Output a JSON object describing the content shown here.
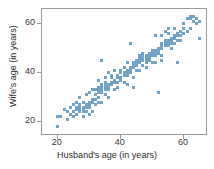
{
  "chart_data": {
    "type": "scatter",
    "title": "",
    "xlabel": "Husband's age (in years)",
    "ylabel": "Wife's age (in years)",
    "xlim": [
      15,
      67
    ],
    "ylim": [
      15,
      66
    ],
    "xticks": [
      20,
      40,
      60
    ],
    "yticks": [
      20,
      40,
      60
    ],
    "xtick_labels": [
      "20",
      "40",
      "60"
    ],
    "ytick_labels": [
      "20",
      "40",
      "60"
    ],
    "grid": false,
    "legend": null,
    "marker": {
      "shape": "square",
      "color": "#6a9fc4",
      "size_px": 3
    },
    "series": [
      {
        "name": "Married couples",
        "points": [
          [
            20,
            18
          ],
          [
            20,
            22
          ],
          [
            21,
            22
          ],
          [
            22,
            25
          ],
          [
            23,
            21
          ],
          [
            23,
            24
          ],
          [
            24,
            23
          ],
          [
            24,
            26
          ],
          [
            25,
            24
          ],
          [
            25,
            27
          ],
          [
            25,
            22
          ],
          [
            26,
            25
          ],
          [
            26,
            26
          ],
          [
            26,
            23
          ],
          [
            26,
            28
          ],
          [
            27,
            24
          ],
          [
            27,
            25
          ],
          [
            27,
            26
          ],
          [
            27,
            27
          ],
          [
            27,
            30
          ],
          [
            28,
            25
          ],
          [
            28,
            26
          ],
          [
            28,
            24
          ],
          [
            28,
            28
          ],
          [
            29,
            26
          ],
          [
            29,
            27
          ],
          [
            29,
            31
          ],
          [
            29,
            24
          ],
          [
            30,
            27
          ],
          [
            30,
            28
          ],
          [
            30,
            26
          ],
          [
            30,
            32
          ],
          [
            31,
            28
          ],
          [
            31,
            29
          ],
          [
            31,
            24
          ],
          [
            31,
            33
          ],
          [
            32,
            29
          ],
          [
            32,
            31
          ],
          [
            32,
            33
          ],
          [
            32,
            27
          ],
          [
            33,
            32
          ],
          [
            33,
            33
          ],
          [
            33,
            34
          ],
          [
            33,
            30
          ],
          [
            33,
            37
          ],
          [
            34,
            33
          ],
          [
            34,
            34
          ],
          [
            34,
            32
          ],
          [
            34,
            35
          ],
          [
            34,
            45
          ],
          [
            35,
            33
          ],
          [
            35,
            34
          ],
          [
            35,
            35
          ],
          [
            35,
            38
          ],
          [
            35,
            36
          ],
          [
            36,
            34
          ],
          [
            36,
            35
          ],
          [
            36,
            40
          ],
          [
            36,
            33
          ],
          [
            37,
            35
          ],
          [
            37,
            36
          ],
          [
            37,
            38
          ],
          [
            37,
            39
          ],
          [
            38,
            36
          ],
          [
            38,
            41
          ],
          [
            38,
            37
          ],
          [
            39,
            38
          ],
          [
            39,
            39
          ],
          [
            39,
            36
          ],
          [
            40,
            38
          ],
          [
            40,
            40
          ],
          [
            40,
            41
          ],
          [
            40,
            37
          ],
          [
            41,
            39
          ],
          [
            41,
            40
          ],
          [
            41,
            42
          ],
          [
            42,
            40
          ],
          [
            42,
            41
          ],
          [
            42,
            39
          ],
          [
            42,
            44
          ],
          [
            43,
            41
          ],
          [
            43,
            42
          ],
          [
            43,
            40
          ],
          [
            43,
            52
          ],
          [
            44,
            43
          ],
          [
            44,
            42
          ],
          [
            44,
            44
          ],
          [
            44,
            34
          ],
          [
            45,
            43
          ],
          [
            45,
            44
          ],
          [
            45,
            45
          ],
          [
            45,
            41
          ],
          [
            46,
            45
          ],
          [
            46,
            44
          ],
          [
            46,
            46
          ],
          [
            46,
            47
          ],
          [
            47,
            46
          ],
          [
            47,
            45
          ],
          [
            47,
            47
          ],
          [
            47,
            43
          ],
          [
            47,
            48
          ],
          [
            48,
            45
          ],
          [
            48,
            46
          ],
          [
            48,
            47
          ],
          [
            48,
            44
          ],
          [
            49,
            46
          ],
          [
            49,
            47
          ],
          [
            49,
            48
          ],
          [
            49,
            45
          ],
          [
            50,
            47
          ],
          [
            50,
            48
          ],
          [
            50,
            49
          ],
          [
            50,
            44
          ],
          [
            51,
            48
          ],
          [
            51,
            49
          ],
          [
            51,
            47
          ],
          [
            51,
            55
          ],
          [
            52,
            49
          ],
          [
            52,
            50
          ],
          [
            52,
            48
          ],
          [
            52,
            32
          ],
          [
            53,
            50
          ],
          [
            53,
            51
          ],
          [
            53,
            52
          ],
          [
            53,
            55
          ],
          [
            53,
            47
          ],
          [
            54,
            51
          ],
          [
            54,
            52
          ],
          [
            54,
            53
          ],
          [
            54,
            57
          ],
          [
            55,
            52
          ],
          [
            55,
            53
          ],
          [
            55,
            51
          ],
          [
            55,
            56
          ],
          [
            55,
            58
          ],
          [
            56,
            53
          ],
          [
            56,
            52
          ],
          [
            56,
            54
          ],
          [
            56,
            50
          ],
          [
            57,
            52
          ],
          [
            57,
            54
          ],
          [
            57,
            55
          ],
          [
            57,
            58
          ],
          [
            58,
            53
          ],
          [
            58,
            55
          ],
          [
            58,
            56
          ],
          [
            58,
            44
          ],
          [
            59,
            55
          ],
          [
            59,
            57
          ],
          [
            59,
            53
          ],
          [
            60,
            56
          ],
          [
            60,
            58
          ],
          [
            60,
            60
          ],
          [
            61,
            57
          ],
          [
            61,
            62
          ],
          [
            62,
            58
          ],
          [
            62,
            63
          ],
          [
            62,
            62
          ],
          [
            63,
            61
          ],
          [
            63,
            63
          ],
          [
            64,
            60
          ],
          [
            64,
            62
          ],
          [
            65,
            54
          ],
          [
            65,
            61
          ],
          [
            34,
            28
          ],
          [
            36,
            30
          ],
          [
            38,
            33
          ],
          [
            42,
            35
          ],
          [
            44,
            38
          ],
          [
            30,
            23
          ],
          [
            28,
            22
          ],
          [
            33,
            28
          ],
          [
            35,
            31
          ],
          [
            48,
            42
          ],
          [
            51,
            44
          ],
          [
            53,
            45
          ],
          [
            46,
            41
          ],
          [
            39,
            34
          ],
          [
            41,
            36
          ]
        ]
      }
    ]
  },
  "axes": {
    "x_tick_labels": [
      "20",
      "40",
      "60"
    ],
    "y_tick_labels": [
      "20",
      "40",
      "60"
    ],
    "x_title": "Husband's age (in years)",
    "y_title": "Wife's age (in years)"
  }
}
